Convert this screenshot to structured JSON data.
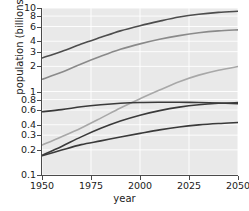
{
  "chart_data": {
    "type": "line",
    "title": "",
    "xlabel": "year",
    "ylabel": "population (billions)",
    "yscale": "log",
    "xlim": [
      1950,
      2050
    ],
    "ylim": [
      0.1,
      10
    ],
    "grid": true,
    "grid_color": "#ffffff",
    "plot_background": "#e9e9e9",
    "legend": "none",
    "xticks": [
      1950,
      1975,
      2000,
      2025,
      2050
    ],
    "xtick_labels": [
      "1950",
      "1975",
      "2000",
      "2025",
      "2050"
    ],
    "yticks": [
      0.1,
      0.2,
      0.3,
      0.4,
      0.6,
      0.8,
      1,
      2,
      3,
      4,
      6,
      8,
      10
    ],
    "ytick_labels": [
      "0.1",
      "0.2",
      "0.3",
      "0.4",
      "0.6",
      "0.8",
      "1",
      "2",
      "3",
      "4",
      "6",
      "8",
      "10"
    ],
    "x": [
      1950,
      1960,
      1970,
      1980,
      1990,
      2000,
      2010,
      2020,
      2030,
      2040,
      2050
    ],
    "series": [
      {
        "name": "series-1",
        "color": "#4d4d4d",
        "width": 1.6,
        "values": [
          2.52,
          3.02,
          3.7,
          4.45,
          5.32,
          6.14,
          6.96,
          7.79,
          8.43,
          8.87,
          9.15
        ]
      },
      {
        "name": "series-2",
        "color": "#8a8a8a",
        "width": 1.6,
        "values": [
          1.4,
          1.7,
          2.14,
          2.64,
          3.2,
          3.72,
          4.22,
          4.67,
          5.05,
          5.32,
          5.47
        ]
      },
      {
        "name": "series-3",
        "color": "#a8a8a8",
        "width": 1.6,
        "values": [
          0.228,
          0.287,
          0.366,
          0.48,
          0.635,
          0.818,
          1.04,
          1.31,
          1.57,
          1.8,
          1.99
        ]
      },
      {
        "name": "series-4",
        "color": "#3a3a3a",
        "width": 1.6,
        "values": [
          0.572,
          0.606,
          0.656,
          0.694,
          0.722,
          0.738,
          0.743,
          0.742,
          0.737,
          0.727,
          0.715
        ]
      },
      {
        "name": "series-5",
        "color": "#3a3a3a",
        "width": 1.6,
        "values": [
          0.172,
          0.22,
          0.286,
          0.362,
          0.443,
          0.52,
          0.59,
          0.65,
          0.695,
          0.722,
          0.735
        ]
      },
      {
        "name": "series-6",
        "color": "#3a3a3a",
        "width": 1.6,
        "values": [
          0.17,
          0.199,
          0.231,
          0.256,
          0.285,
          0.315,
          0.347,
          0.376,
          0.398,
          0.414,
          0.426
        ]
      }
    ]
  }
}
